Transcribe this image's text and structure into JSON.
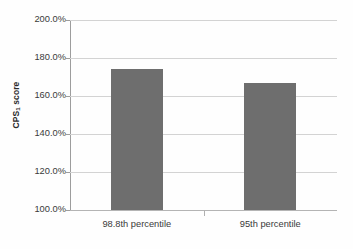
{
  "chart_data": {
    "type": "bar",
    "title": "",
    "xlabel": "",
    "ylabel": "CPS1 score",
    "ylabel_base": "CPS",
    "ylabel_sub": "1",
    "ylabel_suffix": " score",
    "categories": [
      "98.8th percentile",
      "95th percentile"
    ],
    "values": [
      174.0,
      166.8
    ],
    "value_labels": [
      "174.0%",
      "166.8%"
    ],
    "ylim": [
      100.0,
      200.0
    ],
    "ytick_values": [
      200.0,
      180.0,
      160.0,
      140.0,
      120.0,
      100.0
    ],
    "ytick_labels": [
      "200.0%",
      "180.0%",
      "160.0%",
      "140.0%",
      "120.0%",
      "100.0%"
    ],
    "grid": true,
    "legend": false,
    "legend_position": "none",
    "bar_color": "#6e6e6e",
    "gridline_color": "#d3d3d3",
    "axis_color": "#9d9d9d",
    "background_color": "#fefefe",
    "text_color": "#3a3a3a"
  }
}
